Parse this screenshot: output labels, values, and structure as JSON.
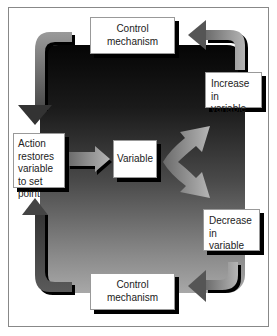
{
  "diagram": {
    "type": "feedback-loop",
    "nodes": {
      "top_control": {
        "label": "Control mechanism"
      },
      "increase": {
        "label": "Increase in variable"
      },
      "action": {
        "label": "Action restores variable to set point"
      },
      "variable": {
        "label": "Variable"
      },
      "decrease": {
        "label": "Decrease in variable"
      },
      "bottom_control": {
        "label": "Control mechanism"
      }
    },
    "edges": [
      {
        "from": "variable",
        "to": "increase"
      },
      {
        "from": "variable",
        "to": "decrease"
      },
      {
        "from": "increase",
        "to": "top_control"
      },
      {
        "from": "top_control",
        "to": "action"
      },
      {
        "from": "decrease",
        "to": "bottom_control"
      },
      {
        "from": "bottom_control",
        "to": "action"
      },
      {
        "from": "action",
        "to": "variable"
      }
    ]
  }
}
